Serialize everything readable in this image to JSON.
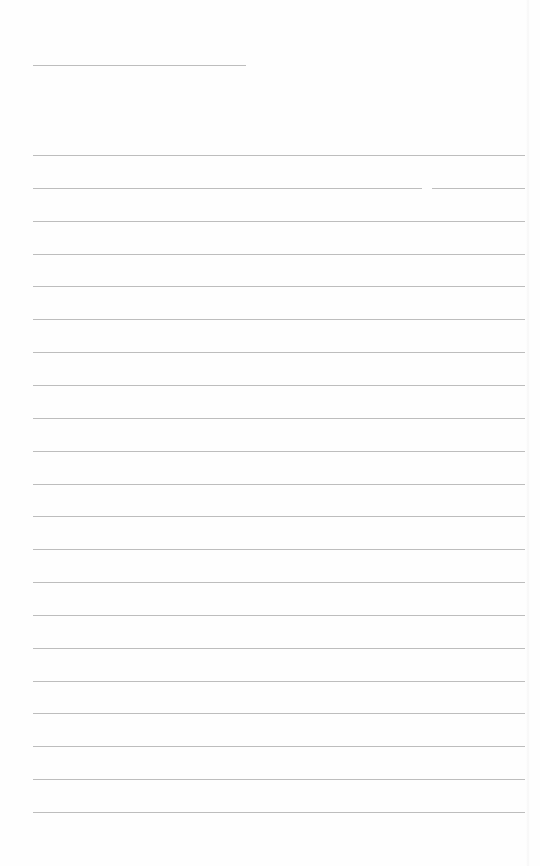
{
  "page": {
    "type": "lined-paper",
    "background_color": "#fefefe",
    "line_color": "#bdbdbd",
    "title_line": {
      "x": 33,
      "y": 65,
      "width": 213
    },
    "lines": {
      "count": 21,
      "start_y": 155,
      "spacing": 32.85,
      "x": 33,
      "width": 492
    },
    "gaps": [
      {
        "line_index": 1,
        "x_start": 422,
        "x_end": 432
      }
    ]
  }
}
